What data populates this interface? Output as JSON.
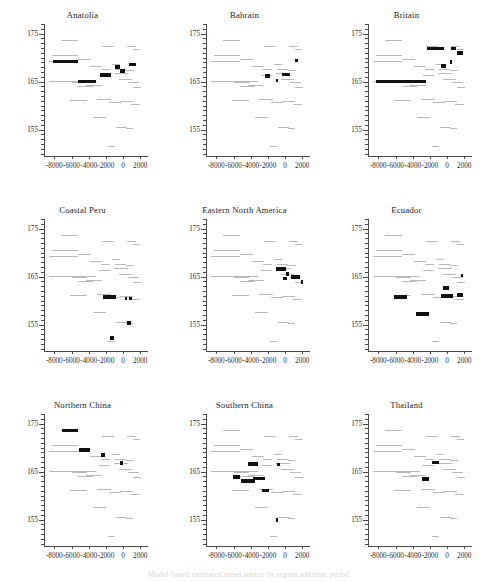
{
  "figure": {
    "type": "multi-panel-scatter",
    "rows": 3,
    "cols": 3,
    "caption_partial": "Model-based estimated mean stature by region and time period",
    "colors": {
      "background_series": "#b9b9b9",
      "highlight_series": "#111111",
      "axis": "#4a4a4a",
      "text": "#232323"
    }
  },
  "axes": {
    "x": {
      "label": "",
      "min": -9200,
      "max": 2900,
      "ticks": [
        -8000,
        -6000,
        -4000,
        -2000,
        0,
        2000
      ],
      "tick_labels": [
        "-8000",
        "-6000",
        "-4000",
        "-2000",
        "0",
        "2000"
      ]
    },
    "y": {
      "label": "",
      "min": 149.5,
      "max": 177.0,
      "ticks": [
        155,
        165,
        175
      ],
      "tick_labels": [
        "155",
        "165",
        "175"
      ],
      "minor_tick_step": 1
    }
  },
  "chart_data": {
    "type": "scatter",
    "title": "",
    "xlabel": "",
    "ylabel": "",
    "xlim": [
      -9200,
      2900
    ],
    "ylim": [
      149.5,
      177.0
    ],
    "grid": false,
    "legend": "none",
    "series_note": "Each panel shows the same light-grey background set of horizontal interval segments (all regions pooled); black bold segments mark the intervals belonging to the panel's own region.",
    "background_segments": [
      {
        "x0": -7200,
        "x1": -5300,
        "y": 173.6
      },
      {
        "x0": -8300,
        "x1": -5300,
        "y": 170.5
      },
      {
        "x0": -2400,
        "x1": -1000,
        "y": 172.3
      },
      {
        "x0": 500,
        "x1": 1500,
        "y": 172.4
      },
      {
        "x0": 1200,
        "x1": 2000,
        "y": 171.6
      },
      {
        "x0": -8600,
        "x1": -5200,
        "y": 169.1
      },
      {
        "x0": -5200,
        "x1": -3700,
        "y": 169.6
      },
      {
        "x0": -3800,
        "x1": -2500,
        "y": 168.1
      },
      {
        "x0": -2600,
        "x1": -1500,
        "y": 167.6
      },
      {
        "x0": -1300,
        "x1": -400,
        "y": 168.5
      },
      {
        "x0": -900,
        "x1": 300,
        "y": 167.5
      },
      {
        "x0": 300,
        "x1": 1300,
        "y": 167.3
      },
      {
        "x0": -8600,
        "x1": -3200,
        "y": 165.0
      },
      {
        "x0": -6000,
        "x1": -4200,
        "y": 164.8
      },
      {
        "x0": -5200,
        "x1": -3500,
        "y": 163.9
      },
      {
        "x0": -4300,
        "x1": -2400,
        "y": 164.2
      },
      {
        "x0": -2800,
        "x1": -1500,
        "y": 166.3
      },
      {
        "x0": -1000,
        "x1": 600,
        "y": 166.6
      },
      {
        "x0": -500,
        "x1": 1000,
        "y": 165.4
      },
      {
        "x0": 600,
        "x1": 1800,
        "y": 164.9
      },
      {
        "x0": 1200,
        "x1": 2100,
        "y": 163.8
      },
      {
        "x0": -6200,
        "x1": -4200,
        "y": 161.0
      },
      {
        "x0": -3000,
        "x1": -1400,
        "y": 161.2
      },
      {
        "x0": -1600,
        "x1": -200,
        "y": 160.6
      },
      {
        "x0": -300,
        "x1": 1100,
        "y": 160.9
      },
      {
        "x0": 900,
        "x1": 2000,
        "y": 160.3
      },
      {
        "x0": -3500,
        "x1": -2000,
        "y": 157.6
      },
      {
        "x0": -800,
        "x1": 400,
        "y": 155.4
      },
      {
        "x0": 300,
        "x1": 1100,
        "y": 155.2
      },
      {
        "x0": -1800,
        "x1": -900,
        "y": 151.4
      }
    ],
    "panels": [
      {
        "id": "anatolia",
        "title": "Anatolia",
        "row": 0,
        "col": 0,
        "highlight_segments": [
          {
            "x0": -8200,
            "x1": -5200,
            "y": 169.2
          },
          {
            "x0": -5300,
            "x1": -3200,
            "y": 165.0
          },
          {
            "x0": -2700,
            "x1": -1400,
            "y": 166.4
          },
          {
            "x0": -900,
            "x1": -400,
            "y": 168.0
          },
          {
            "x0": -300,
            "x1": 200,
            "y": 167.2
          },
          {
            "x0": 700,
            "x1": 1500,
            "y": 168.6
          }
        ]
      },
      {
        "id": "bahrain",
        "title": "Bahrain",
        "row": 0,
        "col": 1,
        "highlight_segments": [
          {
            "x0": -2300,
            "x1": -1800,
            "y": 166.2
          },
          {
            "x0": -1100,
            "x1": -800,
            "y": 165.2
          },
          {
            "x0": -400,
            "x1": 600,
            "y": 166.5
          },
          {
            "x0": 1200,
            "x1": 1500,
            "y": 169.4
          }
        ]
      },
      {
        "id": "britain",
        "title": "Britain",
        "row": 0,
        "col": 2,
        "highlight_segments": [
          {
            "x0": -8300,
            "x1": -2500,
            "y": 165.0
          },
          {
            "x0": -2300,
            "x1": -400,
            "y": 171.9
          },
          {
            "x0": 400,
            "x1": 1000,
            "y": 171.9
          },
          {
            "x0": 1100,
            "x1": 1800,
            "y": 170.9
          },
          {
            "x0": -700,
            "x1": -100,
            "y": 168.2
          },
          {
            "x0": 300,
            "x1": 600,
            "y": 169.1
          }
        ]
      },
      {
        "id": "coastal-peru",
        "title": "Coastal Peru",
        "row": 1,
        "col": 0,
        "highlight_segments": [
          {
            "x0": -2300,
            "x1": -800,
            "y": 160.8
          },
          {
            "x0": 200,
            "x1": 500,
            "y": 160.4
          },
          {
            "x0": 700,
            "x1": 1000,
            "y": 160.4
          },
          {
            "x0": 400,
            "x1": 900,
            "y": 155.3
          },
          {
            "x0": -1500,
            "x1": -1000,
            "y": 152.2
          }
        ]
      },
      {
        "id": "eastern-north-america",
        "title": "Eastern North America",
        "row": 1,
        "col": 1,
        "highlight_segments": [
          {
            "x0": -1100,
            "x1": 100,
            "y": 166.6
          },
          {
            "x0": 100,
            "x1": 400,
            "y": 165.6
          },
          {
            "x0": -200,
            "x1": 200,
            "y": 164.6
          },
          {
            "x0": 700,
            "x1": 1700,
            "y": 164.9
          },
          {
            "x0": 1800,
            "x1": 2100,
            "y": 163.9
          }
        ]
      },
      {
        "id": "ecuador",
        "title": "Ecuador",
        "row": 1,
        "col": 2,
        "highlight_segments": [
          {
            "x0": -6200,
            "x1": -4700,
            "y": 160.8
          },
          {
            "x0": -3600,
            "x1": -2100,
            "y": 157.2
          },
          {
            "x0": -500,
            "x1": 200,
            "y": 162.6
          },
          {
            "x0": -700,
            "x1": 700,
            "y": 161.0
          },
          {
            "x0": 1200,
            "x1": 1800,
            "y": 161.2
          },
          {
            "x0": 1600,
            "x1": 1900,
            "y": 165.2
          }
        ]
      },
      {
        "id": "northern-china",
        "title": "Northern China",
        "row": 2,
        "col": 0,
        "highlight_segments": [
          {
            "x0": -7100,
            "x1": -5300,
            "y": 173.6
          },
          {
            "x0": -5100,
            "x1": -3900,
            "y": 169.5
          },
          {
            "x0": -2600,
            "x1": -2100,
            "y": 168.5
          },
          {
            "x0": -400,
            "x1": 50,
            "y": 166.8
          }
        ]
      },
      {
        "id": "southern-china",
        "title": "Southern China",
        "row": 2,
        "col": 1,
        "highlight_segments": [
          {
            "x0": -4300,
            "x1": -3100,
            "y": 166.6
          },
          {
            "x0": -900,
            "x1": -600,
            "y": 166.5
          },
          {
            "x0": -6100,
            "x1": -5300,
            "y": 163.9
          },
          {
            "x0": -5100,
            "x1": -3500,
            "y": 163.1
          },
          {
            "x0": -3700,
            "x1": -2300,
            "y": 163.6
          },
          {
            "x0": -2700,
            "x1": -1900,
            "y": 161.1
          },
          {
            "x0": -1000,
            "x1": -800,
            "y": 154.9
          }
        ]
      },
      {
        "id": "thailand",
        "title": "Thailand",
        "row": 2,
        "col": 2,
        "highlight_segments": [
          {
            "x0": -1800,
            "x1": -900,
            "y": 166.9
          },
          {
            "x0": -2900,
            "x1": -2100,
            "y": 163.4
          }
        ]
      }
    ]
  }
}
